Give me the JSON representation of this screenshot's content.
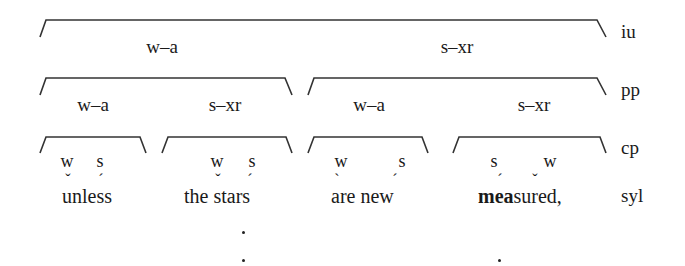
{
  "tiers": {
    "iu": "iu",
    "pp": "pp",
    "cp": "cp",
    "syl": "syl"
  },
  "iu": {
    "labels": [
      "w–a",
      "s–xr"
    ]
  },
  "pp": {
    "left": {
      "labels": [
        "w–a",
        "s–xr"
      ]
    },
    "right": {
      "labels": [
        "w–a",
        "s–xr"
      ]
    }
  },
  "cp": [
    {
      "labels": [
        "w",
        "s"
      ]
    },
    {
      "labels": [
        "w",
        "s"
      ]
    },
    {
      "labels": [
        "w",
        "s"
      ]
    },
    {
      "labels": [
        "s",
        "w"
      ]
    }
  ],
  "syllables": {
    "words": [
      {
        "text": "unless",
        "marks": [
          "breve",
          "acute"
        ]
      },
      {
        "text": "the stars",
        "marks": [
          "breve",
          "acute"
        ]
      },
      {
        "text": "are new",
        "marks": [
          "grave",
          "acute"
        ]
      },
      {
        "text_bold": "mea",
        "text_rest": "sured,",
        "marks": [
          "acute",
          "breve"
        ]
      }
    ],
    "mark_glyphs": {
      "breve": "ˇ",
      "acute": "ˊ",
      "grave": "ˋ"
    }
  },
  "grid_dots": {
    "stars": 2,
    "measured": 1
  }
}
